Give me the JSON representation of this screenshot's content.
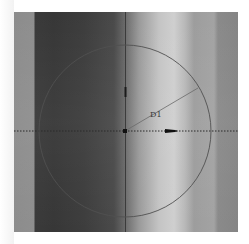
{
  "scene": {
    "description": "CAD sketch view of a circle on a shaded cylinder face",
    "colors": {
      "sketch_line": "#555555",
      "axis_line": "#333333",
      "dark_band": "#383838",
      "light_band": "#cfcfcf"
    }
  },
  "sketch": {
    "circle": {
      "cx": 125,
      "cy": 131,
      "r": 86
    },
    "radius_dimension": {
      "label": "D1",
      "from": [
        125,
        131
      ],
      "to": [
        198,
        88
      ]
    },
    "center_point": {
      "x": 125,
      "y": 131
    },
    "horizontal_axis": {
      "y": 131,
      "style": "dotted"
    },
    "vertical_axis": {
      "x": 125,
      "style": "solid"
    },
    "direction_arrow": {
      "x": 166,
      "y": 131,
      "icon": "arrow-right-icon"
    },
    "vertical_constraint_marker": {
      "x": 125,
      "y1": 87,
      "y2": 97,
      "icon": "vertical-constraint-icon"
    }
  }
}
